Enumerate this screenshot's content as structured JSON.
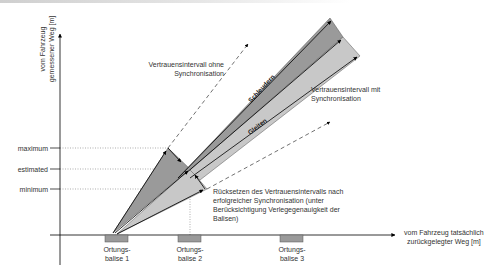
{
  "diagram": {
    "y_axis_label_line1": "vom Fahrzeug",
    "y_axis_label_line2": "gemessener Weg [m]",
    "x_axis_label_line1": "vom Fahrzeug tatsächlich",
    "x_axis_label_line2": "zurückgelegter Weg [m]",
    "levels": {
      "maximum": "maximum",
      "estimated": "estimated",
      "minimum": "minimum"
    },
    "balises": [
      {
        "line1": "Ortungs-",
        "line2": "balise 1"
      },
      {
        "line1": "Ortungs-",
        "line2": "balise 2"
      },
      {
        "line1": "Ortungs-",
        "line2": "balise 3"
      }
    ],
    "annotations": {
      "without_sync_line1": "Vertrauensintervall ohne",
      "without_sync_line2": "Synchronisation",
      "with_sync_line1": "Vertrauensintervall mit",
      "with_sync_line2": "Synchronisation",
      "reset_line1": "Rücksetzen des Vertrauensintervalls nach",
      "reset_line2": "erfolgreicher Synchronisation (unter",
      "reset_line3": "Berücksichtigung Verlegegenauigkeit der",
      "reset_line4": "Balisen)"
    },
    "regions": {
      "upper": "Schleudern",
      "lower": "Gleiten"
    },
    "colors": {
      "dark_region": "#9a9a9a",
      "light_region": "#c8c8c8",
      "balise": "#9a9a9a",
      "line": "#000000"
    }
  }
}
